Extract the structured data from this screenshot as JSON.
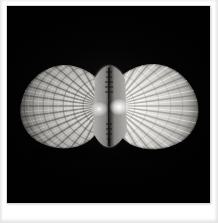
{
  "photograph": {
    "medium": "black-and-white photograph",
    "subject_name": "butterflied bivalve shell",
    "subject_common_name": "scallop shell, both valves opened flat",
    "orientation": "horizontal, hinge centered",
    "background_description": "solid black studio background",
    "presentation": "white photographic border, wider bottom margin",
    "alt_text": "Black and white photograph of a scallop shell opened flat into a butterfly shape, both ribbed valves spread symmetrically from a dark central hinge, lit against a black background."
  },
  "colors": {
    "mat_paper": "#ffffff",
    "mat_edge_shade": "#e2e2e2",
    "plate_background": "#010101",
    "plate_outline": "#d9d9d9",
    "shell_highlight": "#f2f0ed",
    "shell_midtone": "#b9b7b3",
    "shell_shadow": "#4a4845",
    "shell_deep_shadow": "#1a1918",
    "hinge_line": "#070707",
    "umbo_highlight": "#ffffff"
  },
  "geometry": {
    "canvas_width_px": 218,
    "canvas_height_px": 223,
    "plate_left_px": 7,
    "plate_top_px": 6,
    "plate_width_px": 203,
    "plate_height_px": 197,
    "border_top_px": 6,
    "border_left_px": 7,
    "border_right_px": 8,
    "border_bottom_px": 20,
    "specimen_left_px": 18,
    "specimen_right_px": 186,
    "specimen_top_px": 59,
    "specimen_bottom_px": 143,
    "specimen_center_x_px": 100,
    "specimen_center_y_px": 101
  },
  "specimen_parts": {
    "left_valve": {
      "label": "left valve",
      "description": "fan-shaped valve with coarse radiating ribs and strong concentric growth bands, textured and mottled, slightly darker overall",
      "rib_count": 17,
      "tone": "mid-grey with dark rib shadows"
    },
    "right_valve": {
      "label": "right valve",
      "description": "fan-shaped valve with smoother, brighter radiating ribs fanning outward, strong specular highlight near the hinge",
      "rib_count": 17,
      "tone": "bright pale grey to white"
    },
    "hinge": {
      "label": "hinge line",
      "description": "dark vertical seam where the two valves meet, flanked by two bright umbo highlights"
    },
    "umbo_left": {
      "label": "left umbo highlight"
    },
    "umbo_right": {
      "label": "right umbo highlight"
    },
    "auricle_upper": {
      "label": "upper auricles (ears) near hinge"
    },
    "auricle_lower": {
      "label": "lower auricles (ears) near hinge"
    }
  }
}
